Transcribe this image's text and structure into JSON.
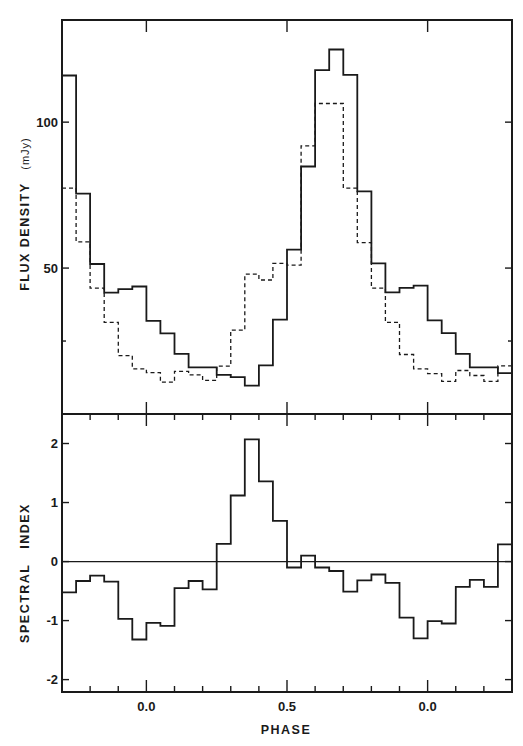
{
  "chart_data": [
    {
      "type": "line",
      "panel": "top",
      "style": "step histogram",
      "title": "",
      "xlabel": "PHASE",
      "ylabel": "FLUX DENSITY",
      "ylabel_unit": "(mJy)",
      "xlim": [
        -0.3,
        1.3
      ],
      "ylim": [
        0,
        135
      ],
      "y_ticks": [
        {
          "value": 50,
          "label": "50"
        },
        {
          "value": 100,
          "label": "100"
        }
      ],
      "y_minor_ticks": [
        25
      ],
      "bin_width": 0.05,
      "x": [
        -0.275,
        -0.225,
        -0.175,
        -0.125,
        -0.075,
        -0.025,
        0.025,
        0.075,
        0.125,
        0.175,
        0.225,
        0.275,
        0.325,
        0.375,
        0.425,
        0.475,
        0.525,
        0.575,
        0.625,
        0.675,
        0.725,
        0.775,
        0.825,
        0.875,
        0.925,
        0.975,
        1.025,
        1.075,
        1.125,
        1.175,
        1.225,
        1.275
      ],
      "series": [
        {
          "name": "solid",
          "line_style": "solid",
          "values": [
            116,
            75.5,
            51.4,
            41.6,
            42.8,
            43.7,
            31.9,
            27.6,
            20.6,
            16.0,
            16.0,
            13.4,
            12.6,
            9.7,
            16.7,
            32.3,
            56.3,
            84.8,
            117.8,
            124.9,
            116.2,
            76.3,
            51.6,
            41.7,
            43.2,
            44.0,
            32.1,
            27.7,
            20.6,
            16.0,
            16.0,
            14.0
          ]
        },
        {
          "name": "dashed",
          "line_style": "dashed",
          "values": [
            77.4,
            59.0,
            43.1,
            31.4,
            20.0,
            15.5,
            14.2,
            10.9,
            14.6,
            13.4,
            11.5,
            16.4,
            28.7,
            47.9,
            45.9,
            51.6,
            51.0,
            91.9,
            106.4,
            106.4,
            77.4,
            58.7,
            43.1,
            31.4,
            20.4,
            15.5,
            13.8,
            11.2,
            14.9,
            13.2,
            11.2,
            16.5
          ]
        }
      ],
      "grid": false,
      "legend": null
    },
    {
      "type": "line",
      "panel": "bottom",
      "style": "step histogram",
      "title": "",
      "xlabel": "PHASE",
      "ylabel": "SPECTRAL   INDEX",
      "xlim": [
        -0.3,
        1.3
      ],
      "ylim": [
        -2.21,
        2.5
      ],
      "y_ticks": [
        {
          "value": 2,
          "label": "2"
        },
        {
          "value": 1,
          "label": "1"
        },
        {
          "value": 0,
          "label": "0"
        },
        {
          "value": -1,
          "label": "-1"
        },
        {
          "value": -2,
          "label": "-2"
        }
      ],
      "reference_line": 0,
      "x_ticks": [
        {
          "value": 0.0,
          "label": "0.0"
        },
        {
          "value": 0.5,
          "label": "0.5"
        },
        {
          "value": 1.0,
          "label": "0.0"
        }
      ],
      "x_minor_ticks": [
        -0.2,
        -0.1,
        0.1,
        0.2,
        0.3,
        0.4,
        0.6,
        0.7,
        0.8,
        0.9,
        1.1,
        1.2
      ],
      "bin_width": 0.05,
      "x": [
        -0.275,
        -0.225,
        -0.175,
        -0.125,
        -0.075,
        -0.025,
        0.025,
        0.075,
        0.125,
        0.175,
        0.225,
        0.275,
        0.325,
        0.375,
        0.425,
        0.475,
        0.525,
        0.575,
        0.625,
        0.675,
        0.725,
        0.775,
        0.825,
        0.875,
        0.925,
        0.975,
        1.025,
        1.075,
        1.125,
        1.175,
        1.225,
        1.275
      ],
      "series": [
        {
          "name": "spectral index",
          "line_style": "solid",
          "values": [
            -0.52,
            -0.33,
            -0.24,
            -0.34,
            -0.97,
            -1.32,
            -1.04,
            -1.09,
            -0.45,
            -0.33,
            -0.47,
            0.3,
            1.12,
            2.07,
            1.36,
            0.69,
            -0.1,
            0.1,
            -0.1,
            -0.16,
            -0.51,
            -0.32,
            -0.22,
            -0.36,
            -0.95,
            -1.3,
            -1.01,
            -1.05,
            -0.43,
            -0.31,
            -0.43,
            0.29
          ]
        }
      ],
      "grid": false,
      "legend": null
    }
  ],
  "labels": {
    "top_ylabel": "FLUX  DENSITY",
    "top_ylabel_unit": "(mJy)",
    "bottom_ylabel": "SPECTRAL   INDEX",
    "xlabel": "PHASE"
  }
}
